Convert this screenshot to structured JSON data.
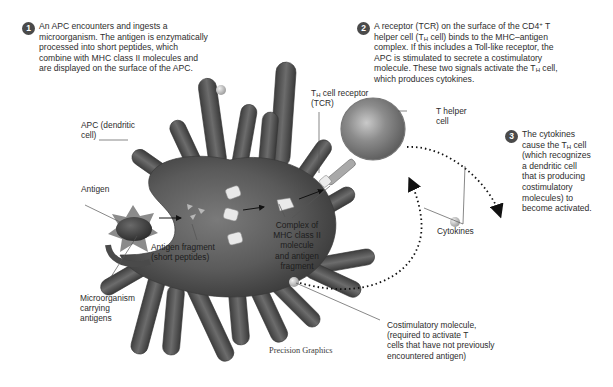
{
  "steps": [
    {
      "number": "1",
      "lines": [
        "An APC encounters and ingests a",
        "microorganism. The antigen is enzymatically",
        "processed into short peptides, which",
        "combine with MHC class II molecules and",
        "are displayed on the surface of the APC."
      ]
    },
    {
      "number": "2",
      "line1_a": "A receptor (TCR) on the surface of the CD4",
      "line1_sup": "+",
      "line1_b": " T",
      "line2_a": "helper cell (T",
      "line2_sub": "H",
      "line2_b": " cell) binds to the MHC–antigen",
      "line3": "complex. If this includes a Toll-like receptor, the",
      "line4": "APC is stimulated to secrete a costimulatory",
      "line5_a": "molecule. These two signals activate the T",
      "line5_sub": "H",
      "line5_b": " cell,",
      "line6": "which produces cytokines."
    },
    {
      "number": "3",
      "line1": "The cytokines",
      "line2_a": "cause the T",
      "line2_sub": "H",
      "line2_b": " cell",
      "line3": "(which recognizes",
      "line4": "a dendritic cell",
      "line5": "that is producing",
      "line6": "costimulatory",
      "line7": "molecules) to",
      "line8": "become activated."
    }
  ],
  "labels": {
    "apc": [
      "APC (dendritic",
      "cell)"
    ],
    "antigen": "Antigen",
    "antigen_fragment": [
      "Antigen fragment",
      "(short peptides)"
    ],
    "microorganism": [
      "Microorganism",
      "carrying",
      "antigens"
    ],
    "tcr_a": "T",
    "tcr_sub": "H",
    "tcr_b": " cell receptor",
    "tcr_c": "(TCR)",
    "t_helper": [
      "T helper",
      "cell"
    ],
    "complex": [
      "Complex of",
      "MHC class II",
      "molecule",
      "and antigen",
      "fragment"
    ],
    "cytokines": "Cytokines",
    "costimulatory": [
      "Costimulatory molecule,",
      "(required to activate T",
      "cells that have not previously",
      "encountered antigen)"
    ]
  },
  "credit": "Precision Graphics",
  "colors": {
    "background": "#ffffff",
    "cell_body": "#5c5c5c",
    "cell_dark": "#3c3c3c",
    "t_cell": "#8e8e8e",
    "badge": "#4a4a4a",
    "text": "#2d2d2d"
  }
}
